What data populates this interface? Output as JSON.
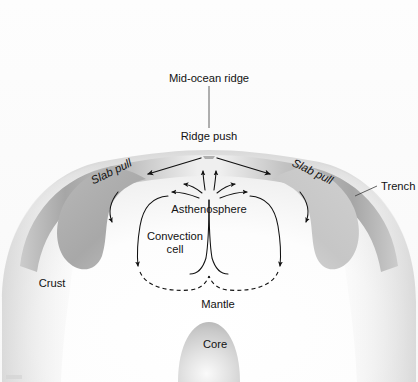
{
  "figure": {
    "background_color": "#fbfbfb",
    "text_color": "#121212"
  },
  "labels": {
    "mid_ocean_ridge": "Mid-ocean ridge",
    "ridge_push": "Ridge push",
    "slab_pull_left": "Slab pull",
    "slab_pull_right": "Slab pull",
    "trench": "Trench",
    "asthenosphere": "Asthenosphere",
    "convection_cell_line1": "Convection",
    "convection_cell_line2": "cell",
    "crust": "Crust",
    "mantle": "Mantle",
    "core": "Core"
  },
  "colors": {
    "crust_band_dark": "#a9a9a9",
    "crust_band_light": "#d8d8d8",
    "mantle_fill": "#fdfdfd",
    "core_fill": "#d5d5d5",
    "arrow_stroke": "#111111",
    "leader_stroke": "#3a3a3a"
  },
  "elements": {
    "slab_left": "subducting-slab-left",
    "slab_right": "subducting-slab-right",
    "convection_cell_left": "convection-cell-left",
    "convection_cell_right": "convection-cell-right",
    "core_sphere": "core-sphere",
    "earth_dome": "earth-dome"
  }
}
